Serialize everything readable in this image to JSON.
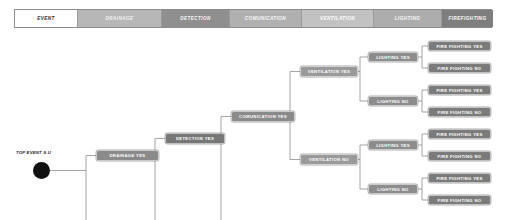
{
  "header": {
    "columns": [
      {
        "label": "EVENT",
        "color": "#ffffff",
        "text_color": "#2b2b2b",
        "width": 63
      },
      {
        "label": "DRAINAGE",
        "color": "#b7b7b7",
        "text_color": "#f2f2f2",
        "width": 84
      },
      {
        "label": "DETECTION",
        "color": "#8f8f8f",
        "text_color": "#f7f7f7",
        "width": 68
      },
      {
        "label": "COMUNICATION",
        "color": "#b0b0b0",
        "text_color": "#fafafa",
        "width": 72
      },
      {
        "label": "VENTILATION",
        "color": "#c2c2c2",
        "text_color": "#ffffff",
        "width": 72
      },
      {
        "label": "LIGHTING",
        "color": "#adadad",
        "text_color": "#fbfbfb",
        "width": 68
      },
      {
        "label": "FIREFIGHTING",
        "color": "#7e7e7e",
        "text_color": "#ffffff",
        "width": 51
      }
    ]
  },
  "tree": {
    "top_event": {
      "label": "TOP EVENT S.U",
      "dot_color": "#111111"
    },
    "nodes": [
      {
        "id": "drainage_yes",
        "label": "DRAINAGE YES",
        "x": 96,
        "y": 150,
        "w": 63,
        "h": 11,
        "color": "#8a8a8a"
      },
      {
        "id": "detection_yes",
        "label": "DETECTION YES",
        "x": 165,
        "y": 133,
        "w": 60,
        "h": 11,
        "color": "#777777"
      },
      {
        "id": "comunication_yes",
        "label": "COMUNICATION YES",
        "x": 231,
        "y": 111,
        "w": 64,
        "h": 11,
        "color": "#8a8a8a"
      },
      {
        "id": "ventilation_yes",
        "label": "VENTILATION YES",
        "x": 300,
        "y": 66,
        "w": 58,
        "h": 11,
        "color": "#9a9a9a"
      },
      {
        "id": "ventilation_no",
        "label": "VENTILATION NO",
        "x": 300,
        "y": 154,
        "w": 58,
        "h": 11,
        "color": "#9a9a9a"
      },
      {
        "id": "lighting_yes_1",
        "label": "LIGHTING YES",
        "x": 368,
        "y": 52,
        "w": 50,
        "h": 10,
        "color": "#8d8d8d"
      },
      {
        "id": "lighting_no_1",
        "label": "LIGHTING NO",
        "x": 368,
        "y": 96,
        "w": 50,
        "h": 10,
        "color": "#8d8d8d"
      },
      {
        "id": "lighting_yes_2",
        "label": "LIGHTING YES",
        "x": 368,
        "y": 140,
        "w": 50,
        "h": 10,
        "color": "#8d8d8d"
      },
      {
        "id": "lighting_no_2",
        "label": "LIGHTING NO",
        "x": 368,
        "y": 184,
        "w": 50,
        "h": 10,
        "color": "#8d8d8d"
      },
      {
        "id": "ff_1",
        "label": "FIRE FIGHTING YES",
        "x": 428,
        "y": 41,
        "w": 63,
        "h": 10,
        "color": "#7b7b7b"
      },
      {
        "id": "ff_2",
        "label": "FIRE FIGHTING NO",
        "x": 428,
        "y": 63,
        "w": 63,
        "h": 10,
        "color": "#7b7b7b"
      },
      {
        "id": "ff_3",
        "label": "FIRE FIGHTING YES",
        "x": 428,
        "y": 85,
        "w": 63,
        "h": 10,
        "color": "#7b7b7b"
      },
      {
        "id": "ff_4",
        "label": "FIRE FIGHTING NO",
        "x": 428,
        "y": 107,
        "w": 63,
        "h": 10,
        "color": "#7b7b7b"
      },
      {
        "id": "ff_5",
        "label": "FIRE FIGHTING YES",
        "x": 428,
        "y": 129,
        "w": 63,
        "h": 10,
        "color": "#7b7b7b"
      },
      {
        "id": "ff_6",
        "label": "FIRE FIGHTING NO",
        "x": 428,
        "y": 151,
        "w": 63,
        "h": 10,
        "color": "#7b7b7b"
      },
      {
        "id": "ff_7",
        "label": "FIRE FIGHTING YES",
        "x": 428,
        "y": 173,
        "w": 63,
        "h": 10,
        "color": "#7b7b7b"
      },
      {
        "id": "ff_8",
        "label": "FIRE FIGHTING NO",
        "x": 428,
        "y": 195,
        "w": 63,
        "h": 10,
        "color": "#7b7b7b"
      }
    ],
    "line_color": "#8e8e8e"
  }
}
